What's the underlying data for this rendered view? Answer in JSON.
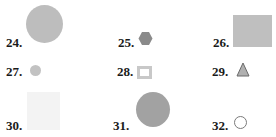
{
  "items": [
    {
      "number": "24.",
      "shape": "circle",
      "fill": "#bdbdbd",
      "size": "large"
    },
    {
      "number": "25.",
      "shape": "hexagon",
      "fill": "#8a8a8a",
      "size": "small"
    },
    {
      "number": "26.",
      "shape": "rectangle",
      "fill": "#bfbfbf",
      "size": "large"
    },
    {
      "number": "27.",
      "shape": "circle",
      "fill": "#c2c2c2",
      "size": "small"
    },
    {
      "number": "28.",
      "shape": "square-outline",
      "fill": "#ffffff",
      "stroke": "#c8c8c8",
      "size": "small"
    },
    {
      "number": "29.",
      "shape": "triangle",
      "fill": "#b0b0b0",
      "stroke": "#6a6a6a",
      "size": "small"
    },
    {
      "number": "30.",
      "shape": "square",
      "fill": "#f3f3f3",
      "size": "large"
    },
    {
      "number": "31.",
      "shape": "circle",
      "fill": "#a2a2a2",
      "size": "large"
    },
    {
      "number": "32.",
      "shape": "circle-outline",
      "fill": "#ffffff",
      "stroke": "#7a7a7a",
      "size": "small"
    }
  ]
}
